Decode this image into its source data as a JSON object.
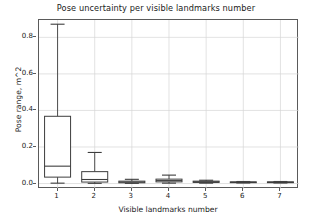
{
  "chart_data": {
    "type": "box",
    "title": "Pose uncertainty per visible landmarks number",
    "xlabel": "Visible landmarks number",
    "ylabel": "Pose range, m^2",
    "categories": [
      "1",
      "2",
      "3",
      "4",
      "5",
      "6",
      "7"
    ],
    "xtick_labels": [
      "1",
      "2",
      "3",
      "4",
      "5",
      "6",
      "7"
    ],
    "ytick_labels": [
      "0.0",
      "0.2",
      "0.4",
      "0.6",
      "0.8"
    ],
    "ytick_values": [
      0.0,
      0.2,
      0.4,
      0.6,
      0.8
    ],
    "ylim": [
      -0.03,
      0.895
    ],
    "xlim": [
      0.5,
      7.5
    ],
    "grid": true,
    "grid_color": "#d6d6d6",
    "legend": "none",
    "box_color": "#3d3d3d",
    "box_fill": "#ffffff",
    "boxes": [
      {
        "category": "1",
        "whisker_low": 0.002,
        "q1": 0.035,
        "median": 0.095,
        "q3": 0.368,
        "whisker_high": 0.872
      },
      {
        "category": "2",
        "whisker_low": 0.001,
        "q1": 0.008,
        "median": 0.022,
        "q3": 0.065,
        "whisker_high": 0.17
      },
      {
        "category": "3",
        "whisker_low": 0.001,
        "q1": 0.004,
        "median": 0.008,
        "q3": 0.013,
        "whisker_high": 0.023
      },
      {
        "category": "4",
        "whisker_low": 0.002,
        "q1": 0.009,
        "median": 0.016,
        "q3": 0.024,
        "whisker_high": 0.046
      },
      {
        "category": "5",
        "whisker_low": 0.002,
        "q1": 0.006,
        "median": 0.009,
        "q3": 0.013,
        "whisker_high": 0.018
      },
      {
        "category": "6",
        "whisker_low": 0.003,
        "q1": 0.005,
        "median": 0.007,
        "q3": 0.009,
        "whisker_high": 0.011
      },
      {
        "category": "7",
        "whisker_low": 0.003,
        "q1": 0.005,
        "median": 0.007,
        "q3": 0.009,
        "whisker_high": 0.011
      }
    ]
  }
}
